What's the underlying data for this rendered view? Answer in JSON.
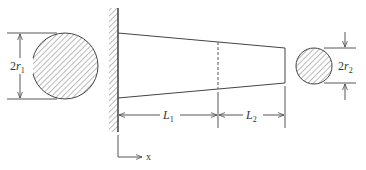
{
  "diagram": {
    "left_section": {
      "label_main": "2",
      "label_var": "r",
      "label_sub": "1"
    },
    "right_section": {
      "label_main": "2",
      "label_var": "r",
      "label_sub": "2"
    },
    "segments": [
      {
        "label_var": "L",
        "label_sub": "1"
      },
      {
        "label_var": "L",
        "label_sub": "2"
      }
    ],
    "axis": {
      "label": "x"
    },
    "colors": {
      "stroke": "#444444",
      "hatch": "#777777",
      "background": "#ffffff"
    }
  }
}
